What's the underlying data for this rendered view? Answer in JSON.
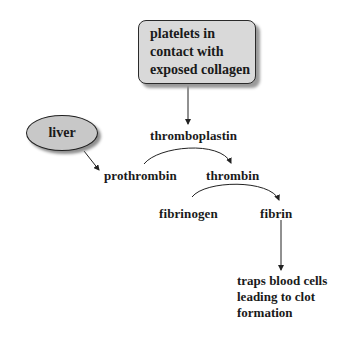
{
  "diagram": {
    "title_box": {
      "lines": [
        "platelets in",
        "contact with",
        "exposed collagen"
      ],
      "fill": "#d9d9d9"
    },
    "source_oval": {
      "label": "liver",
      "fill": "#c8c8c8"
    },
    "nodes": {
      "thromboplastin": "thromboplastin",
      "prothrombin": "prothrombin",
      "thrombin": "thrombin",
      "fibrinogen": "fibrinogen",
      "fibrin": "fibrin"
    },
    "outcome": {
      "lines": [
        "traps blood cells",
        "leading to clot",
        "formation"
      ]
    },
    "edges": [
      {
        "from": "platelets in contact with exposed collagen",
        "to": "thromboplastin"
      },
      {
        "from": "liver",
        "to": "prothrombin"
      },
      {
        "from": "prothrombin",
        "to": "thrombin",
        "via": "thromboplastin"
      },
      {
        "from": "fibrinogen",
        "to": "fibrin",
        "via": "thrombin"
      },
      {
        "from": "fibrin",
        "to": "traps blood cells leading to clot formation"
      }
    ]
  }
}
